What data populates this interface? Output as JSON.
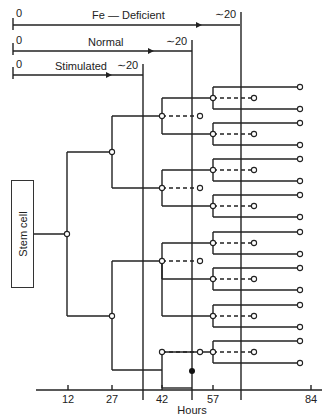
{
  "diagram": {
    "type": "cell-lineage-tree",
    "stem_cell_label": "Stem cell",
    "x_axis": {
      "label": "Hours",
      "ticks": [
        "12",
        "27",
        "42",
        "57",
        "84"
      ]
    },
    "conditions": [
      {
        "name": "Fe — Deficient",
        "start": "0",
        "end": "∼20"
      },
      {
        "name": "Normal",
        "start": "0",
        "end": "∼20"
      },
      {
        "name": "Stimulated",
        "start": "0",
        "end": "∼20"
      }
    ],
    "legend": {
      "open_circle": "cell division node / terminal cell",
      "dashed_line": "branch ending early",
      "filled_circle": "terminal node"
    }
  }
}
